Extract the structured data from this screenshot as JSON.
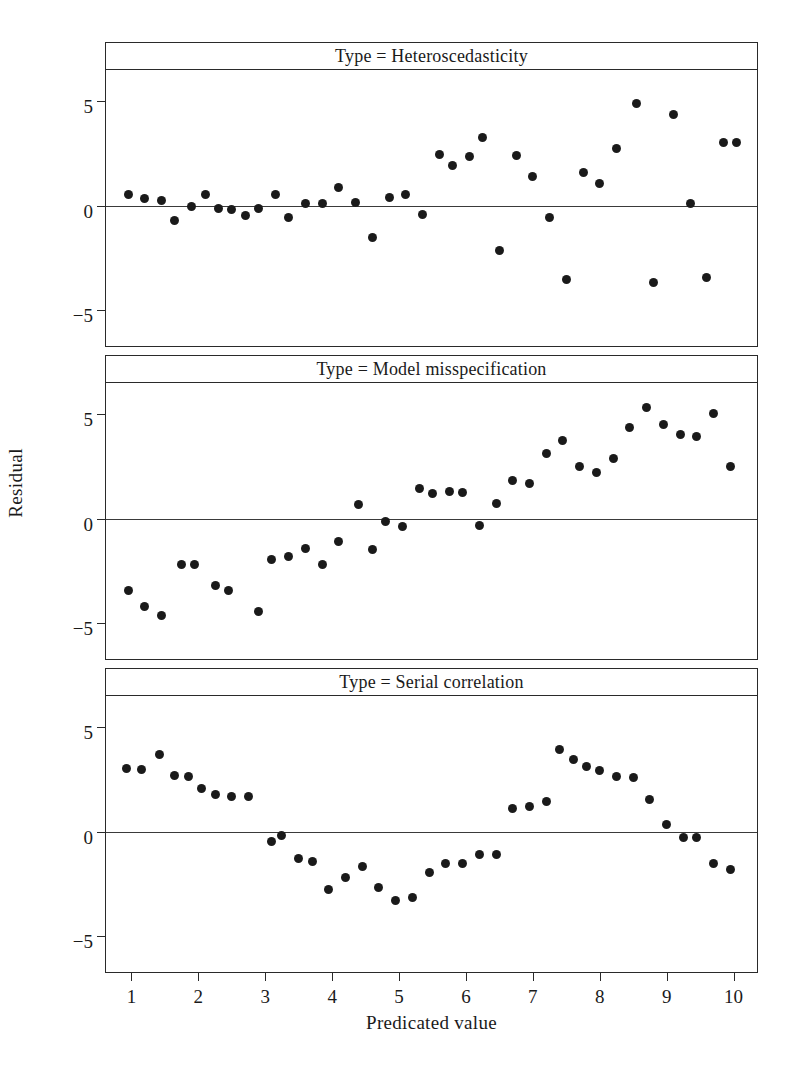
{
  "figure": {
    "ylabel": "Residual",
    "xlabel": "Predicated value",
    "marker_color": "#8b8b8b",
    "axis_color": "#2a2a2a"
  },
  "axes": {
    "xticks": [
      1,
      2,
      3,
      4,
      5,
      6,
      7,
      8,
      9,
      10
    ],
    "xtick_labels": [
      "1",
      "2",
      "3",
      "4",
      "5",
      "6",
      "7",
      "8",
      "9",
      "10"
    ],
    "yticks": [
      5,
      0,
      -5
    ],
    "ytick_labels": [
      "5",
      "0",
      "−5"
    ],
    "xlim": [
      0.62,
      10.35
    ],
    "ylim": [
      -6.7,
      6.5
    ],
    "grid": false
  },
  "chart_data": [
    {
      "type": "scatter",
      "title": "Type = Heteroscedasticity",
      "xlabel": "Predicated value",
      "ylabel": "Residual",
      "xlim": [
        0.62,
        10.35
      ],
      "ylim": [
        -6.7,
        6.5
      ],
      "grid": false,
      "zero_reference_line": 0,
      "x": [
        0.95,
        1.2,
        1.45,
        1.65,
        1.9,
        2.1,
        2.3,
        2.5,
        2.7,
        2.9,
        3.15,
        3.35,
        3.6,
        3.85,
        4.1,
        4.35,
        4.6,
        4.85,
        5.1,
        5.35,
        5.6,
        5.8,
        6.05,
        6.25,
        6.5,
        6.75,
        7.0,
        7.25,
        7.5,
        7.75,
        8.0,
        8.25,
        8.55,
        8.8,
        9.1,
        9.35,
        9.6,
        9.85,
        10.05
      ],
      "y": [
        0.55,
        0.35,
        0.25,
        -0.7,
        -0.05,
        0.55,
        -0.1,
        -0.15,
        -0.45,
        -0.1,
        0.55,
        -0.55,
        0.1,
        0.1,
        0.9,
        0.15,
        -1.5,
        0.4,
        0.55,
        -0.4,
        2.45,
        1.95,
        2.35,
        3.25,
        -2.15,
        2.4,
        1.4,
        -0.55,
        -3.5,
        1.6,
        1.05,
        2.75,
        4.9,
        -3.65,
        4.35,
        0.1,
        -3.4,
        3.05,
        3.05
      ]
    },
    {
      "type": "scatter",
      "title": "Type = Model misspecification",
      "xlabel": "Predicated value",
      "ylabel": "Residual",
      "xlim": [
        0.62,
        10.35
      ],
      "ylim": [
        -6.7,
        6.5
      ],
      "grid": false,
      "zero_reference_line": 0,
      "x": [
        0.95,
        1.2,
        1.45,
        1.75,
        1.95,
        2.25,
        2.45,
        2.9,
        3.1,
        3.35,
        3.6,
        3.85,
        4.1,
        4.4,
        4.6,
        4.8,
        5.05,
        5.3,
        5.5,
        5.75,
        5.95,
        6.2,
        6.45,
        6.7,
        6.95,
        7.2,
        7.45,
        7.7,
        7.95,
        8.2,
        8.45,
        8.7,
        8.95,
        9.2,
        9.45,
        9.7,
        9.95
      ],
      "y": [
        -3.4,
        -4.2,
        -4.6,
        -2.2,
        -2.2,
        -3.2,
        -3.4,
        -4.45,
        -1.95,
        -1.8,
        -1.4,
        -2.2,
        -1.1,
        0.7,
        -1.45,
        -0.1,
        -0.35,
        1.45,
        1.2,
        1.3,
        1.25,
        -0.3,
        0.75,
        1.85,
        1.7,
        3.15,
        3.75,
        2.5,
        2.2,
        2.9,
        4.35,
        5.35,
        4.5,
        4.05,
        3.95,
        5.05,
        2.5
      ]
    },
    {
      "type": "scatter",
      "title": "Type = Serial correlation",
      "xlabel": "Predicated value",
      "ylabel": "Residual",
      "xlim": [
        0.62,
        10.35
      ],
      "ylim": [
        -6.7,
        6.5
      ],
      "grid": false,
      "zero_reference_line": 0,
      "x": [
        0.92,
        1.15,
        1.42,
        1.65,
        1.85,
        2.05,
        2.25,
        2.5,
        2.75,
        3.1,
        3.25,
        3.5,
        3.7,
        3.95,
        4.2,
        4.45,
        4.7,
        4.95,
        5.2,
        5.45,
        5.7,
        5.95,
        6.2,
        6.45,
        6.7,
        6.95,
        7.2,
        7.4,
        7.6,
        7.8,
        8.0,
        8.25,
        8.5,
        8.75,
        9.0,
        9.25,
        9.45,
        9.7,
        9.95
      ],
      "y": [
        3.05,
        3.0,
        3.7,
        2.7,
        2.65,
        2.1,
        1.8,
        1.7,
        1.7,
        -0.45,
        -0.15,
        -1.25,
        -1.4,
        -2.75,
        -2.2,
        -1.65,
        -2.65,
        -3.3,
        -3.15,
        -1.95,
        -1.5,
        -1.5,
        -1.1,
        -1.1,
        1.1,
        1.2,
        1.45,
        3.95,
        3.45,
        3.15,
        2.95,
        2.65,
        2.6,
        1.55,
        0.35,
        -0.25,
        -0.25,
        -1.5,
        -1.8
      ]
    }
  ]
}
